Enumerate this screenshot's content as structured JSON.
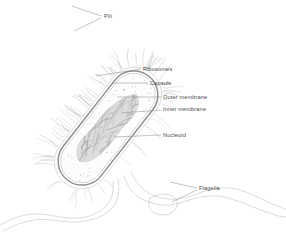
{
  "figure": {
    "style": "pencil line drawing, grayscale",
    "background_color": "#ffffff",
    "line_color": "#a8a8a8",
    "label_color": "#4a4a4a"
  },
  "labels": [
    {
      "id": "pili",
      "text": "Pili",
      "text_x": 104,
      "text_y": 18,
      "anchor": "start",
      "leader": "M101,16 L72,6 M101,18 L74,31",
      "points_to": "hair-like projections on upper-left of cell"
    },
    {
      "id": "ribosomes",
      "text": "Ribosomes",
      "text_x": 143,
      "text_y": 71,
      "anchor": "start",
      "leader": "M141,69 L96,76",
      "points_to": "small dots in cytoplasm"
    },
    {
      "id": "capsule",
      "text": "Capsule",
      "text_x": 150,
      "text_y": 85,
      "anchor": "start",
      "leader": "M148,83 L113,83",
      "points_to": "outermost gel layer"
    },
    {
      "id": "outer-membrane",
      "text": "Outer membrane",
      "text_x": 163,
      "text_y": 99,
      "anchor": "start",
      "leader": "M161,97 L117,97",
      "points_to": "outer lipid bilayer"
    },
    {
      "id": "inner-membrane",
      "text": "Inner membrane",
      "text_x": 163,
      "text_y": 111,
      "anchor": "start",
      "leader": "M161,110 L121,113",
      "points_to": "plasma membrane"
    },
    {
      "id": "nucleoid",
      "text": "Nucleoid",
      "text_x": 163,
      "text_y": 137,
      "anchor": "start",
      "leader": "M161,135 L114,137",
      "points_to": "condensed DNA region"
    },
    {
      "id": "flagella",
      "text": "Flagella",
      "text_x": 199,
      "text_y": 190,
      "anchor": "start",
      "leader": "M197,188 L170,182 M197,190 L172,202",
      "points_to": "long whip-like tails at lower right"
    }
  ],
  "structures": {
    "capsule": "outermost diffuse halo surrounding cell wall",
    "outer_membrane": "dark double line forming rod outline",
    "inner_membrane": "thin line just inside outer membrane",
    "cytoplasm": "pale interior filled with fine stipple",
    "nucleoid": "dense fibrous gray mass along cell long axis",
    "ribosomes": "scattered fine dots within cytoplasm",
    "pili": "many short wavy filaments radiating from capsule",
    "flagella": "four long sinuous filaments trailing to lower right and left"
  },
  "cell_geometry": {
    "orientation_degrees": -52,
    "center_x": 108,
    "center_y": 128,
    "length": 140,
    "width": 52
  }
}
